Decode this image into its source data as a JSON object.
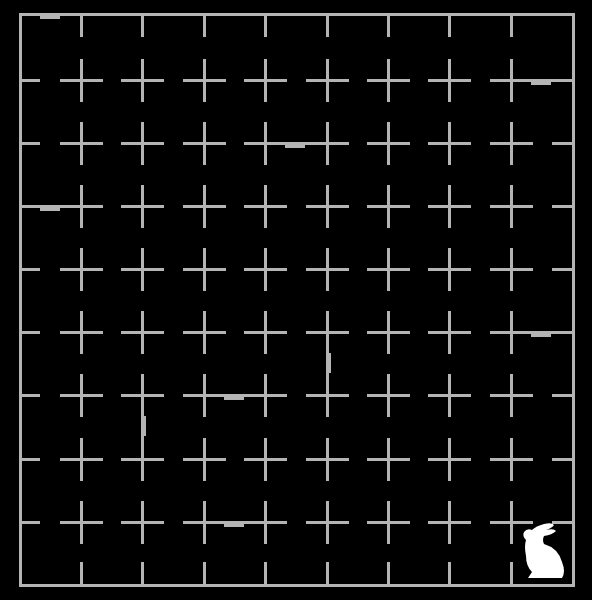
{
  "game": {
    "type": "maze-grid",
    "columns": 9,
    "rows": 9,
    "colors": {
      "background": "#000000",
      "line": "#b4b4b4",
      "player": "#ffffff"
    },
    "grid_x": [
      19,
      80,
      141,
      203,
      264,
      326,
      387,
      448,
      510,
      572
    ],
    "grid_y": [
      13,
      79,
      142,
      205,
      268,
      331,
      394,
      458,
      521,
      584
    ],
    "arm": 20,
    "walls": [
      {
        "orient": "h",
        "row": 1,
        "col": 8,
        "mark": true
      },
      {
        "orient": "h",
        "row": 2,
        "col": 4,
        "mark": true
      },
      {
        "orient": "h",
        "row": 3,
        "col": 0,
        "mark": true
      },
      {
        "orient": "h",
        "row": 5,
        "col": 8,
        "mark": true
      },
      {
        "orient": "v",
        "row": 5,
        "col": 5,
        "mark": true
      },
      {
        "orient": "h",
        "row": 6,
        "col": 3,
        "mark": true
      },
      {
        "orient": "v",
        "row": 6,
        "col": 2,
        "mark": true
      },
      {
        "orient": "h",
        "row": 8,
        "col": 3,
        "mark": true
      },
      {
        "orient": "h",
        "row": 0,
        "col": 0,
        "mark": true
      }
    ],
    "player": {
      "icon": "rabbit-icon",
      "row": 8,
      "col": 8
    }
  }
}
